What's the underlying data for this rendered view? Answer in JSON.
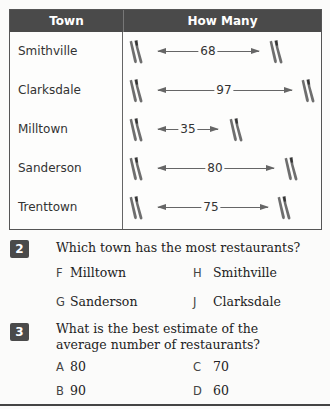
{
  "table": {
    "headers": {
      "town": "Town",
      "how_many": "How Many"
    },
    "rows": [
      {
        "town": "Smithville",
        "count": "68"
      },
      {
        "town": "Clarksdale",
        "count": "97"
      },
      {
        "town": "Milltown",
        "count": "35"
      },
      {
        "town": "Sanderson",
        "count": "80"
      },
      {
        "town": "Trenttown",
        "count": "75"
      }
    ],
    "icon": "fork-and-knife-icon"
  },
  "questions": [
    {
      "number": "2",
      "text": "Which town has the most restaurants?",
      "choices": [
        {
          "letter": "F",
          "text": "Milltown"
        },
        {
          "letter": "G",
          "text": "Sanderson"
        },
        {
          "letter": "H",
          "text": "Smithville"
        },
        {
          "letter": "J",
          "text": "Clarksdale"
        }
      ]
    },
    {
      "number": "3",
      "text_line1": "What is the best estimate of the",
      "text_line2": "average number of restaurants?",
      "choices": [
        {
          "letter": "A",
          "text": "80"
        },
        {
          "letter": "B",
          "text": "90"
        },
        {
          "letter": "C",
          "text": "70"
        },
        {
          "letter": "D",
          "text": "60"
        }
      ]
    }
  ],
  "colors": {
    "header_bg": "#4a4a4a",
    "badge_bg": "#4a4a4a",
    "icon": "#6e6e6e"
  }
}
